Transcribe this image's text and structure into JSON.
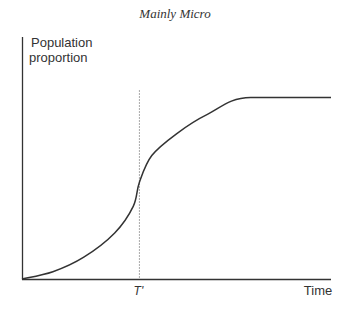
{
  "chart_data": {
    "type": "line",
    "title": "Mainly Micro",
    "xlabel": "Time",
    "ylabel_lines": [
      "Population",
      "proportion"
    ],
    "xlim": [
      0,
      1
    ],
    "ylim": [
      0,
      1
    ],
    "grid": false,
    "legend": null,
    "annotations": [
      {
        "label": "T'",
        "x": 0.38,
        "style": "dotted-vertical-line"
      }
    ],
    "series": [
      {
        "name": "population proportion",
        "points": [
          {
            "x": 0.0,
            "y": 0.0
          },
          {
            "x": 0.1,
            "y": 0.03
          },
          {
            "x": 0.2,
            "y": 0.09
          },
          {
            "x": 0.3,
            "y": 0.19
          },
          {
            "x": 0.36,
            "y": 0.3
          },
          {
            "x": 0.38,
            "y": 0.4
          },
          {
            "x": 0.42,
            "y": 0.51
          },
          {
            "x": 0.5,
            "y": 0.6
          },
          {
            "x": 0.6,
            "y": 0.68
          },
          {
            "x": 0.74,
            "y": 0.75
          },
          {
            "x": 1.0,
            "y": 0.75
          }
        ]
      }
    ]
  },
  "colors": {
    "axis": "#333333",
    "curve": "#333333",
    "marker_line": "#aaaaaa"
  }
}
